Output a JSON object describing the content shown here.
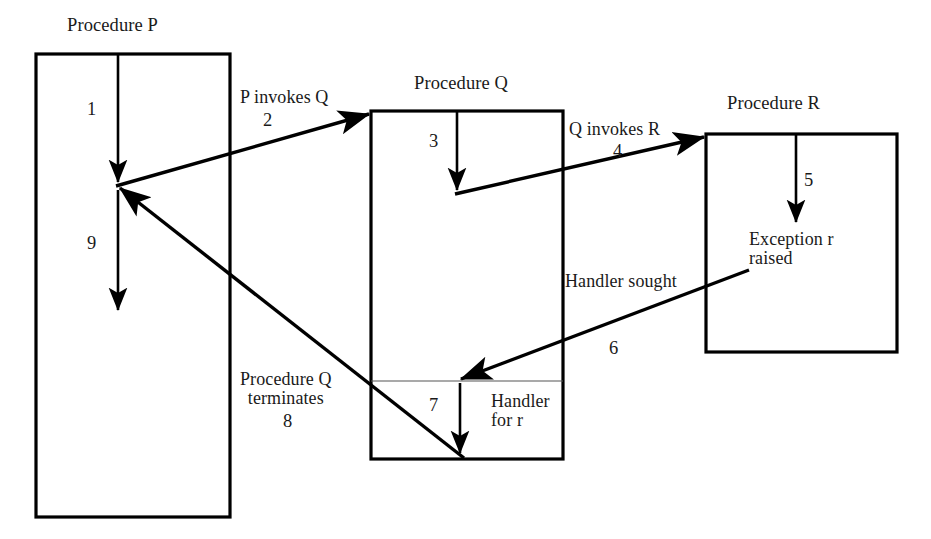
{
  "diagram": {
    "kind": "exception-propagation-sequence-diagram",
    "background_color": "#ffffff",
    "line_color": "#000000",
    "titles": {
      "procedure_p": "Procedure P",
      "procedure_q": "Procedure Q",
      "procedure_r": "Procedure R"
    },
    "notes": {
      "p_invokes_q": "P invokes Q",
      "q_invokes_r": "Q invokes R",
      "handler_sought": "Handler sought",
      "exception_raised": "Exception r\nraised",
      "handler_for_r": "Handler\nfor r",
      "procedure_q_terminates": "Procedure Q\nterminates"
    },
    "step_numbers": {
      "s1": "1",
      "s2": "2",
      "s3": "3",
      "s4": "4",
      "s5": "5",
      "s6": "6",
      "s7": "7",
      "s8": "8",
      "s9": "9"
    },
    "steps": [
      {
        "id": "1",
        "label": "1",
        "from": "Procedure P start",
        "to": "P call point",
        "kind": "execution"
      },
      {
        "id": "2",
        "label": "2",
        "note": "P invokes Q",
        "from": "Procedure P",
        "to": "Procedure Q",
        "kind": "call"
      },
      {
        "id": "3",
        "label": "3",
        "from": "Procedure Q start",
        "to": "Q call point",
        "kind": "execution"
      },
      {
        "id": "4",
        "label": "4",
        "note": "Q invokes R",
        "from": "Procedure Q",
        "to": "Procedure R",
        "kind": "call"
      },
      {
        "id": "5",
        "label": "5",
        "from": "Procedure R start",
        "to": "Exception r raised",
        "kind": "execution"
      },
      {
        "id": "6",
        "label": "6",
        "note": "Handler sought",
        "from": "Procedure R",
        "to": "Handler for r in Q",
        "kind": "exception-propagation"
      },
      {
        "id": "7",
        "label": "7",
        "from": "Handler for r start",
        "to": "Handler for r end",
        "kind": "execution"
      },
      {
        "id": "8",
        "label": "8",
        "note": "Procedure Q terminates",
        "from": "Procedure Q",
        "to": "Procedure P",
        "kind": "return"
      },
      {
        "id": "9",
        "label": "9",
        "from": "P resume point",
        "to": "P continues",
        "kind": "execution"
      }
    ]
  }
}
